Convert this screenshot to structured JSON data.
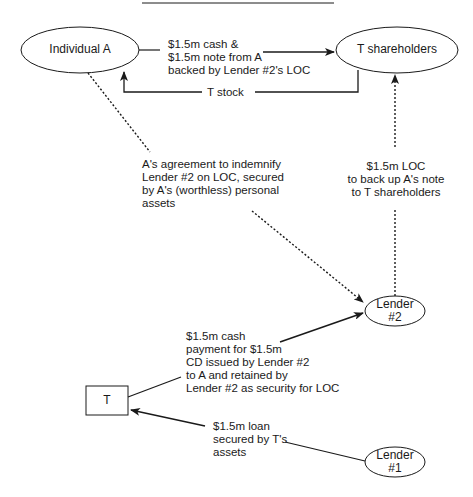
{
  "nodes": {
    "individual_a": {
      "label": "Individual A"
    },
    "t_shareholders": {
      "label": "T shareholders"
    },
    "lender2": {
      "lines": [
        "Lender",
        "#2"
      ]
    },
    "t": {
      "label": "T"
    },
    "lender1": {
      "lines": [
        "Lender",
        "#1"
      ]
    }
  },
  "edges": {
    "cash_and_note": {
      "lines": [
        "$1.5m cash &",
        "$1.5m note from  A",
        "backed by Lender #2's LOC"
      ]
    },
    "t_stock": {
      "label": "T stock"
    },
    "indemnify": {
      "lines": [
        "A's agreement to indemnify",
        "Lender #2 on LOC, secured",
        "by A's (worthless) personal",
        "assets"
      ]
    },
    "loc": {
      "lines": [
        "$1.5m LOC",
        "to back up A's note",
        "to T shareholders"
      ]
    },
    "cd_payment": {
      "lines": [
        "$1.5m cash",
        "payment for $1.5m",
        "CD issued by Lender #2",
        "to A and retained by",
        "Lender #2 as security for LOC"
      ]
    },
    "loan": {
      "lines": [
        "$1.5m loan",
        "secured by T's",
        "assets"
      ]
    }
  },
  "colors": {
    "line": "#1a1a1a",
    "background": "#ffffff"
  }
}
